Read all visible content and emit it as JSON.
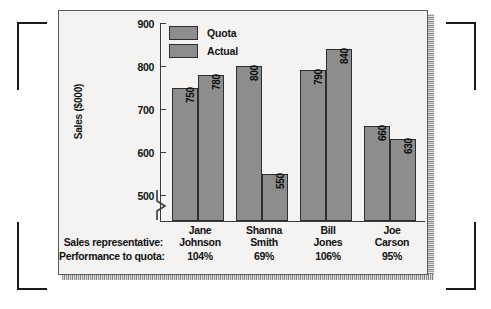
{
  "chart_data": {
    "type": "bar",
    "title": "",
    "xlabel": "",
    "ylabel": "Sales ($000)",
    "ylim": [
      460,
      900
    ],
    "yticks": [
      500,
      600,
      700,
      800,
      900
    ],
    "ytick_labels": [
      "500",
      "600",
      "700",
      "800",
      "900"
    ],
    "axis_break": true,
    "grid": false,
    "legend_position": "top-left-inside",
    "categories": [
      "Jane Johnson",
      "Shanna Smith",
      "Bill Jones",
      "Joe Carson"
    ],
    "series": [
      {
        "name": "Quota",
        "values": [
          750,
          800,
          790,
          660
        ],
        "color": "#8d8d8d"
      },
      {
        "name": "Actual",
        "values": [
          780,
          550,
          840,
          630
        ],
        "color": "#8d8d8d"
      }
    ],
    "annotations": {
      "performance_to_quota": [
        "104%",
        "69%",
        "106%",
        "95%"
      ]
    }
  },
  "legend": {
    "items": [
      {
        "label": "Quota"
      },
      {
        "label": "Actual"
      }
    ]
  },
  "axis": {
    "y_title": "Sales ($000)",
    "y_labels": [
      "900",
      "800",
      "700",
      "600",
      "500"
    ]
  },
  "categories": [
    {
      "line1": "Jane",
      "line2": "Johnson",
      "pct": "104%"
    },
    {
      "line1": "Shanna",
      "line2": "Smith",
      "pct": "69%"
    },
    {
      "line1": "Bill",
      "line2": "Jones",
      "pct": "106%"
    },
    {
      "line1": "Joe",
      "line2": "Carson",
      "pct": "95%"
    }
  ],
  "bar_labels": {
    "g0s0": "750",
    "g0s1": "780",
    "g1s0": "800",
    "g1s1": "550",
    "g2s0": "790",
    "g2s1": "840",
    "g3s0": "660",
    "g3s1": "630"
  },
  "footer": {
    "row1_label": "Sales representative:",
    "row2_label": "Performance to quota:"
  },
  "colors": {
    "bar_fill": "#8d8d8d",
    "bar_stroke": "#2e2e2e",
    "panel_bg": "#f4f3f1",
    "axis": "#3b3b3b",
    "text": "#111111"
  }
}
